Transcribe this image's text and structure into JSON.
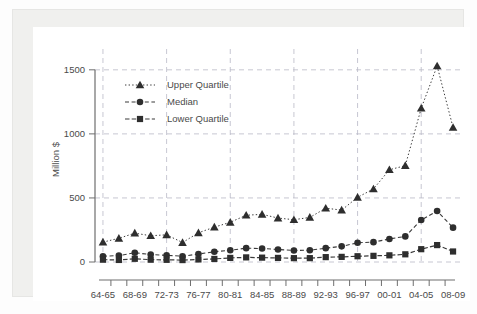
{
  "figure": {
    "y_axis_title": "Million $",
    "background_color": "#ffffff",
    "panel_color": "#f0f0ee",
    "series_color": "#2e2e2e",
    "grid_color": "#b9b9c6",
    "axis_color": "#6e6e6e"
  },
  "chart_data": {
    "type": "line",
    "title": "",
    "subtitle": "",
    "xlabel": "",
    "ylabel": "Million $",
    "ylim": [
      0,
      1600
    ],
    "yticks": [
      0,
      500,
      1000,
      1500
    ],
    "ytick_labels": [
      "0",
      "500",
      "1000",
      "1500"
    ],
    "grid": true,
    "grid_axis": "both",
    "legend_position": "top-left",
    "x": [
      "64-65",
      "65-66",
      "66-67",
      "67-68",
      "68-69",
      "69-70",
      "70-71",
      "71-72",
      "72-73",
      "73-74",
      "74-75",
      "75-76",
      "76-77",
      "77-78",
      "78-79",
      "79-80",
      "80-81",
      "81-82",
      "82-83",
      "83-84",
      "84-85",
      "85-86",
      "86-87",
      "87-88",
      "88-89",
      "89-90",
      "90-91",
      "91-92",
      "92-93",
      "93-94",
      "94-95",
      "95-96",
      "96-97",
      "97-98",
      "98-99",
      "99-00",
      "00-01",
      "01-02",
      "02-03",
      "03-04",
      "04-05",
      "05-06",
      "06-07",
      "07-08",
      "08-09"
    ],
    "xtick_labels": [
      "64-65",
      "68-69",
      "72-73",
      "76-77",
      "80-81",
      "84-85",
      "88-89",
      "92-93",
      "96-97",
      "00-01",
      "04-05",
      "08-09"
    ],
    "xtick_label_interval": 2,
    "categories": [
      "64-65",
      "66-67",
      "68-69",
      "70-71",
      "72-73",
      "74-75",
      "76-77",
      "78-79",
      "80-81",
      "82-83",
      "84-85",
      "86-87",
      "88-89",
      "90-91",
      "92-93",
      "94-95",
      "96-97",
      "98-99",
      "00-01",
      "02-03",
      "04-05",
      "06-07",
      "08-09"
    ],
    "series": [
      {
        "name": "Upper Quartile",
        "marker": "triangle",
        "linestyle": "dotted",
        "values": [
          155,
          185,
          225,
          205,
          212,
          152,
          228,
          272,
          310,
          365,
          372,
          343,
          330,
          348,
          420,
          405,
          505,
          570,
          720,
          752,
          1200,
          1530,
          1050
        ]
      },
      {
        "name": "Median",
        "marker": "circle",
        "linestyle": "dashed",
        "values": [
          45,
          50,
          72,
          58,
          52,
          45,
          62,
          80,
          92,
          108,
          105,
          98,
          90,
          92,
          108,
          122,
          150,
          155,
          180,
          200,
          328,
          398,
          268
        ]
      },
      {
        "name": "Lower Quartile",
        "marker": "square",
        "linestyle": "dashed",
        "values": [
          18,
          16,
          25,
          18,
          17,
          15,
          20,
          24,
          32,
          36,
          34,
          32,
          30,
          30,
          38,
          40,
          45,
          48,
          52,
          60,
          100,
          132,
          82
        ]
      }
    ]
  },
  "legend": {
    "entries": [
      {
        "label": "Upper Quartile",
        "marker": "triangle-marker-icon"
      },
      {
        "label": "Median",
        "marker": "circle-marker-icon"
      },
      {
        "label": "Lower Quartile",
        "marker": "square-marker-icon"
      }
    ]
  }
}
